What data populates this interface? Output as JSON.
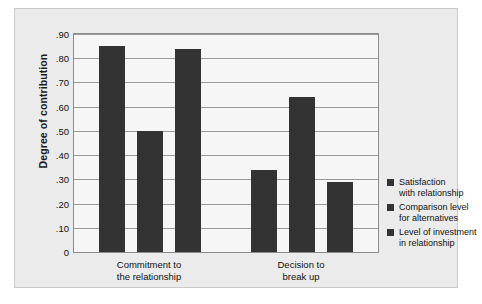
{
  "chart_data": {
    "type": "bar",
    "title": "",
    "xlabel": "",
    "ylabel": "Degree of contribution",
    "ylim": [
      0,
      0.9
    ],
    "grid": true,
    "legend_position": "right",
    "categories": [
      "Commitment to the relationship",
      "Decision to break up"
    ],
    "category_lines": [
      [
        "Commitment to",
        "the relationship"
      ],
      [
        "Decision to",
        "break up"
      ]
    ],
    "yticks": [
      ".90",
      ".80",
      ".70",
      ".60",
      ".50",
      ".40",
      ".30",
      ".20",
      ".10",
      "0"
    ],
    "ytick_values": [
      0.9,
      0.8,
      0.7,
      0.6,
      0.5,
      0.4,
      0.3,
      0.2,
      0.1,
      0
    ],
    "series": [
      {
        "name": "Satisfaction with relationship",
        "name_lines": [
          "Satisfaction",
          "with relationship"
        ],
        "color": "#333333",
        "values": [
          0.85,
          0.34
        ]
      },
      {
        "name": "Comparison level for alternatives",
        "name_lines": [
          "Comparison level",
          "for alternatives"
        ],
        "color": "#333333",
        "values": [
          0.5,
          0.64
        ]
      },
      {
        "name": "Level of investment in relationship",
        "name_lines": [
          "Level of investment",
          "in relationship"
        ],
        "color": "#333333",
        "values": [
          0.84,
          0.29
        ]
      }
    ]
  }
}
